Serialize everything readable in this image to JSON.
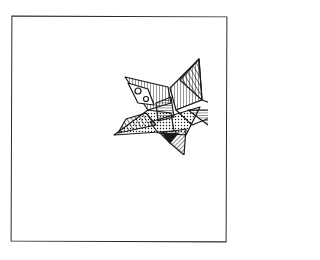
{
  "illustration": {
    "subject": "patterned folded paper star",
    "ink_color": "#1a1a1a",
    "paper_color": "#ffffff",
    "frame_color": "#2a2a2a"
  }
}
